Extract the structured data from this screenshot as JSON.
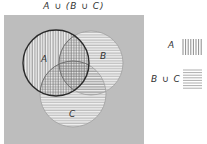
{
  "title": "A ∪ (B ∪ C)",
  "colors": {
    "universe": "#bdbdbd",
    "circle_fill": "#f2f2f2",
    "hatch": "#7a7a7a",
    "outline_A": "#2a2a2a",
    "outline_other": "#9a9a9a",
    "text": "#333333"
  },
  "sets": [
    {
      "name": "A",
      "label": "A",
      "cx": 56,
      "cy": 63,
      "r": 33,
      "hatch": "vertical"
    },
    {
      "name": "B",
      "label": "B",
      "cx": 91,
      "cy": 63,
      "r": 32,
      "hatch": "horizontal"
    },
    {
      "name": "C",
      "label": "C",
      "cx": 73,
      "cy": 94,
      "r": 33,
      "hatch": "horizontal"
    }
  ],
  "legend": [
    {
      "label": "A",
      "pattern": "vertical lines"
    },
    {
      "label": "B ∪ C",
      "pattern": "horizontal lines"
    }
  ]
}
